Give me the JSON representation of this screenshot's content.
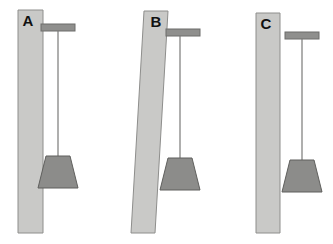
{
  "figure": {
    "type": "physics-diagram",
    "background_color": "#ffffff",
    "width": 333,
    "height": 244
  },
  "colors": {
    "post_fill": "#c9c9c7",
    "post_stroke": "#8e8e8c",
    "bar_fill": "#8f8f8d",
    "bar_stroke": "#6d6d6b",
    "weight_fill": "#8c8c8a",
    "weight_stroke": "#5f5f5d",
    "string_stroke": "#7a7a78",
    "label_color": "#111111"
  },
  "panels": [
    {
      "id": "a",
      "label": "A",
      "label_x": 28,
      "label_y": 22,
      "post": {
        "tilted": false,
        "top_left_x": 18,
        "top_right_x": 43,
        "bottom_left_x": 18,
        "bottom_right_x": 43,
        "top_y": 10,
        "bottom_y": 233
      },
      "bar": {
        "attached": true,
        "x": 41,
        "y": 24,
        "width": 34,
        "height": 7
      },
      "string": {
        "x": 58,
        "top_y": 31,
        "bottom_y": 156
      },
      "weight": {
        "center_x": 58,
        "top_y": 156,
        "bottom_y": 188,
        "top_half_width": 12,
        "bottom_half_width": 20
      }
    },
    {
      "id": "b",
      "label": "B",
      "label_x": 156,
      "label_y": 23,
      "post": {
        "tilted": true,
        "top_left_x": 144,
        "top_right_x": 168,
        "bottom_left_x": 131,
        "bottom_right_x": 155,
        "top_y": 11,
        "bottom_y": 233
      },
      "bar": {
        "attached": true,
        "x": 166,
        "y": 29,
        "width": 34,
        "height": 7
      },
      "string": {
        "x": 180,
        "top_y": 36,
        "bottom_y": 158
      },
      "weight": {
        "center_x": 180,
        "top_y": 158,
        "bottom_y": 190,
        "top_half_width": 12,
        "bottom_half_width": 20
      }
    },
    {
      "id": "c",
      "label": "C",
      "label_x": 266,
      "label_y": 25,
      "post": {
        "tilted": false,
        "top_left_x": 256,
        "top_right_x": 280,
        "bottom_left_x": 256,
        "bottom_right_x": 280,
        "top_y": 13,
        "bottom_y": 233
      },
      "bar": {
        "attached": false,
        "x": 285,
        "y": 32,
        "width": 34,
        "height": 7
      },
      "string": {
        "x": 302,
        "top_y": 39,
        "bottom_y": 160
      },
      "weight": {
        "center_x": 302,
        "top_y": 160,
        "bottom_y": 192,
        "top_half_width": 12,
        "bottom_half_width": 20
      }
    }
  ]
}
